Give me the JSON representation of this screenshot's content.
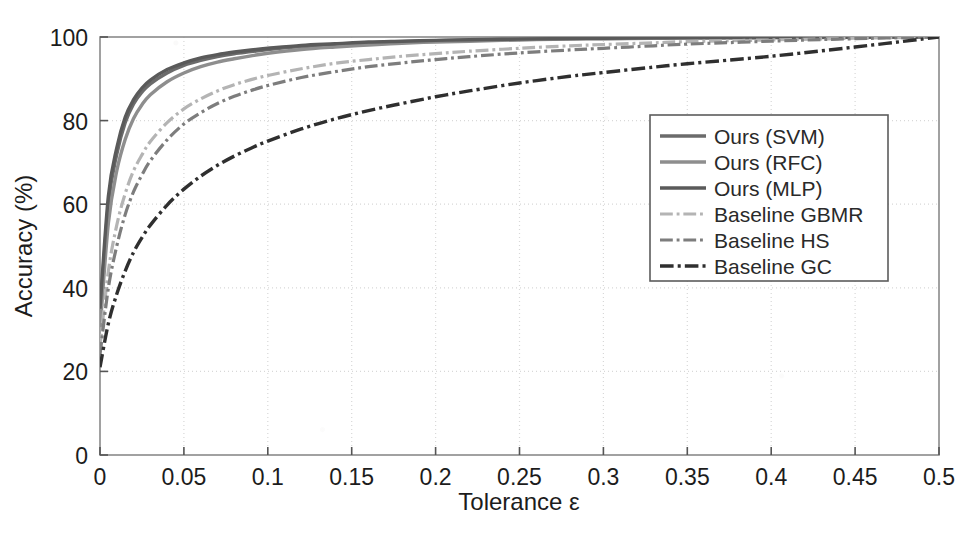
{
  "chart_data": {
    "type": "line",
    "title": "",
    "xlabel": "Tolerance  ε",
    "ylabel": "Accuracy (%)",
    "xlim": [
      0,
      0.5
    ],
    "ylim": [
      0,
      100
    ],
    "xticks": [
      "0",
      "0.05",
      "0.1",
      "0.15",
      "0.2",
      "0.25",
      "0.3",
      "0.35",
      "0.4",
      "0.45",
      "0.5"
    ],
    "xtick_values": [
      0,
      0.05,
      0.1,
      0.15,
      0.2,
      0.25,
      0.3,
      0.35,
      0.4,
      0.45,
      0.5
    ],
    "yticks": [
      "0",
      "20",
      "40",
      "60",
      "80",
      "100"
    ],
    "ytick_values": [
      0,
      20,
      40,
      60,
      80,
      100
    ],
    "grid": true,
    "grid_style": "dotted",
    "legend_position": "center-right",
    "x": [
      0,
      0.005,
      0.01,
      0.015,
      0.02,
      0.025,
      0.03,
      0.04,
      0.05,
      0.06,
      0.07,
      0.08,
      0.09,
      0.1,
      0.12,
      0.14,
      0.16,
      0.18,
      0.2,
      0.22,
      0.25,
      0.28,
      0.3,
      0.33,
      0.35,
      0.4,
      0.45,
      0.5
    ],
    "series": [
      {
        "name": "Ours (SVM)",
        "color": "#6b6b6b",
        "style": "solid",
        "width": 3.4,
        "values": [
          33,
          60,
          72,
          79.5,
          84,
          86.8,
          88.8,
          91.4,
          93.2,
          94.4,
          95.3,
          96.0,
          96.5,
          97.0,
          97.7,
          98.2,
          98.6,
          98.9,
          99.1,
          99.25,
          99.45,
          99.6,
          99.65,
          99.75,
          99.8,
          99.88,
          99.94,
          100
        ]
      },
      {
        "name": "Ours (RFC)",
        "color": "#8e8e8e",
        "style": "solid",
        "width": 3.4,
        "values": [
          30,
          55.5,
          68,
          75.5,
          80.5,
          83.8,
          86.2,
          89.3,
          91.4,
          92.9,
          94.0,
          94.8,
          95.5,
          96.1,
          97.0,
          97.6,
          98.1,
          98.5,
          98.8,
          99.0,
          99.3,
          99.5,
          99.58,
          99.7,
          99.76,
          99.86,
          99.93,
          100
        ]
      },
      {
        "name": "Ours (MLP)",
        "color": "#5a5a5a",
        "style": "solid",
        "width": 3.4,
        "values": [
          35,
          62,
          73.5,
          80.8,
          85,
          87.8,
          89.7,
          92.2,
          93.8,
          95.0,
          95.8,
          96.4,
          96.9,
          97.3,
          98.0,
          98.4,
          98.8,
          99.0,
          99.2,
          99.35,
          99.5,
          99.65,
          99.7,
          99.8,
          99.84,
          99.9,
          99.95,
          100
        ]
      },
      {
        "name": "Baseline GBMR",
        "color": "#b4b4b4",
        "style": "dashdot",
        "width": 3.2,
        "values": [
          26,
          44,
          55,
          62.5,
          68,
          71.8,
          75,
          79.5,
          82.8,
          85.2,
          87.1,
          88.6,
          89.8,
          90.8,
          92.4,
          93.7,
          94.6,
          95.4,
          96.0,
          96.6,
          97.3,
          97.9,
          98.2,
          98.6,
          98.9,
          99.3,
          99.7,
          100
        ]
      },
      {
        "name": "Baseline HS",
        "color": "#7d7d7d",
        "style": "dashdot",
        "width": 3.2,
        "values": [
          24,
          40,
          50,
          57.5,
          63,
          67,
          70.4,
          75.4,
          79.2,
          81.9,
          84.1,
          85.8,
          87.2,
          88.4,
          90.3,
          91.7,
          92.9,
          93.8,
          94.6,
          95.3,
          96.2,
          96.9,
          97.3,
          97.9,
          98.3,
          99.0,
          99.6,
          100
        ]
      },
      {
        "name": "Baseline GC",
        "color": "#2f2f2f",
        "style": "dashdot",
        "width": 3.4,
        "values": [
          21,
          31.5,
          38.5,
          44,
          48.5,
          52,
          55,
          59.8,
          63.6,
          66.7,
          69.3,
          71.5,
          73.4,
          75.1,
          78,
          80.4,
          82.4,
          84.1,
          85.7,
          87.1,
          89,
          90.6,
          91.5,
          92.8,
          93.6,
          95.4,
          97.6,
          100
        ]
      }
    ]
  },
  "axes": {
    "x_axis_name": "tolerance-axis",
    "y_axis_name": "accuracy-axis"
  }
}
